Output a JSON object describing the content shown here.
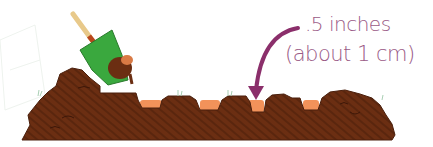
{
  "illustration": {
    "subject": "trowel digging shallow planting holes in soil",
    "annotation": {
      "line1": ".5 inches",
      "line2": "(about 1 cm)"
    },
    "colors": {
      "soil": "#6b2e12",
      "soil_dark": "#4a1f0c",
      "hole": "#f2925a",
      "trowel_blade": "#3aa83e",
      "trowel_handle": "#e8c98a",
      "trowel_collar": "#b8461c",
      "arrow": "#8b2f6b",
      "grass": "#b7d8c0"
    },
    "hole_count": 5
  }
}
